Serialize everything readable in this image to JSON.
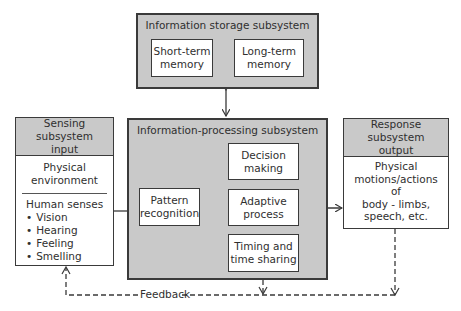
{
  "storage": {
    "title": "Information storage subsystem",
    "short_term": [
      "Short-term",
      "memory"
    ],
    "long_term": [
      "Long-term",
      "memory"
    ]
  },
  "sensing": {
    "title": [
      "Sensing subsystem",
      "input"
    ],
    "physical": [
      "Physical",
      "environment"
    ],
    "senses_title": "Human senses",
    "senses": [
      "Vision",
      "Hearing",
      "Feeling",
      "Smelling"
    ]
  },
  "processing": {
    "title": "Information-processing subsystem",
    "pattern": [
      "Pattern",
      "recognition"
    ],
    "decision": [
      "Decision",
      "making"
    ],
    "adaptive": [
      "Adaptive",
      "process"
    ],
    "timing": [
      "Timing and",
      "time sharing"
    ]
  },
  "response": {
    "title": [
      "Response subsystem",
      "output"
    ],
    "body": [
      "Physical",
      "motions/actions",
      "of",
      "body - limbs,",
      "speech, etc."
    ]
  },
  "feedback": {
    "label": "Feedback"
  },
  "colors": {
    "box_gray": "#c9c9c9",
    "line": "#3a3a3a"
  }
}
